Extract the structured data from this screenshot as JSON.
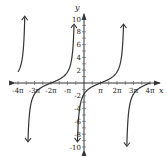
{
  "chart_data": {
    "type": "line",
    "title": "",
    "function": "y = tan((x - π)/3)",
    "xlabel": "x",
    "ylabel": "y",
    "xlim": [
      -4.3,
      4.6
    ],
    "ylim": [
      -10.5,
      10.8
    ],
    "x_unit": "π",
    "grid": false,
    "x_ticks": [
      {
        "value": -4,
        "label": "-4π"
      },
      {
        "value": -3,
        "label": "-3π"
      },
      {
        "value": -2,
        "label": "-2π"
      },
      {
        "value": -1,
        "label": "-π"
      },
      {
        "value": 1,
        "label": "π"
      },
      {
        "value": 2,
        "label": "2π"
      },
      {
        "value": 3,
        "label": "3π"
      },
      {
        "value": 4,
        "label": "4π"
      }
    ],
    "y_ticks": [
      {
        "value": 10,
        "label": "10"
      },
      {
        "value": 8,
        "label": "8"
      },
      {
        "value": 6,
        "label": "6"
      },
      {
        "value": 4,
        "label": "4"
      },
      {
        "value": 2,
        "label": "2"
      },
      {
        "value": -2,
        "label": "-2"
      },
      {
        "value": -4,
        "label": "-4"
      },
      {
        "value": -6,
        "label": "-6"
      },
      {
        "value": -8,
        "label": "-8"
      },
      {
        "value": -10,
        "label": "-10"
      }
    ],
    "asymptotes_x_in_pi": [
      -3.5,
      -0.5,
      2.5
    ],
    "zeros_x_in_pi": [
      -2,
      1,
      4
    ],
    "branches": [
      {
        "name": "left-branch",
        "x_range_pi": [
          -4,
          -3.5
        ],
        "end_arrow": "up"
      },
      {
        "name": "middle-branch",
        "x_range_pi": [
          -3.5,
          -0.5
        ],
        "start_arrow": "down",
        "end_arrow": "up"
      },
      {
        "name": "center-branch",
        "x_range_pi": [
          -0.5,
          2.5
        ],
        "start_arrow": "down",
        "end_arrow": "up"
      },
      {
        "name": "right-branch",
        "x_range_pi": [
          2.5,
          4
        ],
        "start_arrow": "down"
      }
    ],
    "colors": {
      "curve": "#333333",
      "axis": "#333333"
    }
  }
}
